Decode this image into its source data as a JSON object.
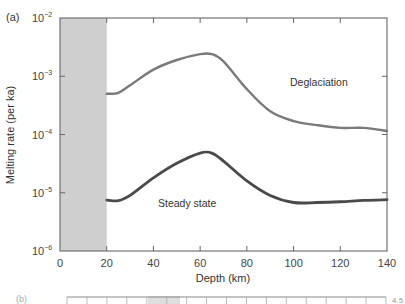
{
  "chart_data": {
    "type": "line",
    "panel_label": "(a)",
    "title": "",
    "xlabel": "Depth (km)",
    "ylabel": "Melting rate (per ka)",
    "xlim": [
      0,
      140
    ],
    "ylim": [
      1e-06,
      0.01
    ],
    "yscale": "log",
    "x_ticks": [
      "0",
      "20",
      "40",
      "60",
      "80",
      "100",
      "120",
      "140"
    ],
    "y_ticks": [
      "10-6",
      "10-5",
      "10-4",
      "10-3",
      "10-2"
    ],
    "grid": false,
    "shaded_region": {
      "x_from": 0,
      "x_to": 20,
      "color": "#cfcfcf"
    },
    "series": [
      {
        "name": "Deglaciation",
        "color": "#7a7a7a",
        "x": [
          20,
          25,
          30,
          40,
          50,
          60,
          65,
          70,
          80,
          90,
          100,
          110,
          120,
          130,
          140
        ],
        "values": [
          0.0005,
          0.00052,
          0.0007,
          0.0013,
          0.0019,
          0.0024,
          0.0024,
          0.0018,
          0.0006,
          0.00025,
          0.00017,
          0.000145,
          0.00013,
          0.00013,
          0.000115
        ]
      },
      {
        "name": "Steady state",
        "color": "#4a4a4a",
        "x": [
          20,
          25,
          30,
          40,
          50,
          60,
          65,
          70,
          80,
          90,
          100,
          110,
          120,
          130,
          140
        ],
        "values": [
          7.5e-06,
          7.3e-06,
          9e-06,
          1.8e-05,
          3.2e-05,
          4.8e-05,
          4.8e-05,
          3.5e-05,
          1.6e-05,
          9e-06,
          6.8e-06,
          6.8e-06,
          7e-06,
          7.4e-06,
          7.6e-06
        ]
      }
    ],
    "annotations": [
      {
        "text": "Deglaciation",
        "x": 100,
        "y": 0.0008
      },
      {
        "text": "Steady state",
        "x": 52,
        "y": 5e-06
      }
    ],
    "legend": "none (inline labels)"
  },
  "labels": {
    "panel": "(a)",
    "xlabel": "Depth (km)",
    "ylabel": "Melting rate (per ka)",
    "deglaciation": "Deglaciation",
    "steady_state": "Steady state",
    "panel_b": "(b)",
    "panel_b_right": "4.5"
  }
}
